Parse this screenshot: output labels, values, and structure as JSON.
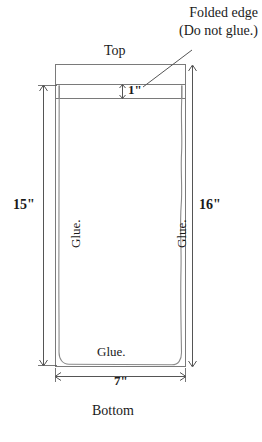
{
  "diagram": {
    "title_callout": {
      "line1": "Folded edge",
      "line2": "(Do not glue.)"
    },
    "labels": {
      "top": "Top",
      "bottom": "Bottom",
      "glue_left": "Glue.",
      "glue_right": "Glue.",
      "glue_bottom": "Glue."
    },
    "dimensions": {
      "left_height": "15\"",
      "right_height": "16\"",
      "fold_strip": "1\"",
      "width": "7\""
    },
    "colors": {
      "outline": "#7a7a7a",
      "inner_outline": "#8a8a8a",
      "dimension_line": "#555555",
      "text": "#1a1a1a",
      "background": "#ffffff"
    }
  }
}
